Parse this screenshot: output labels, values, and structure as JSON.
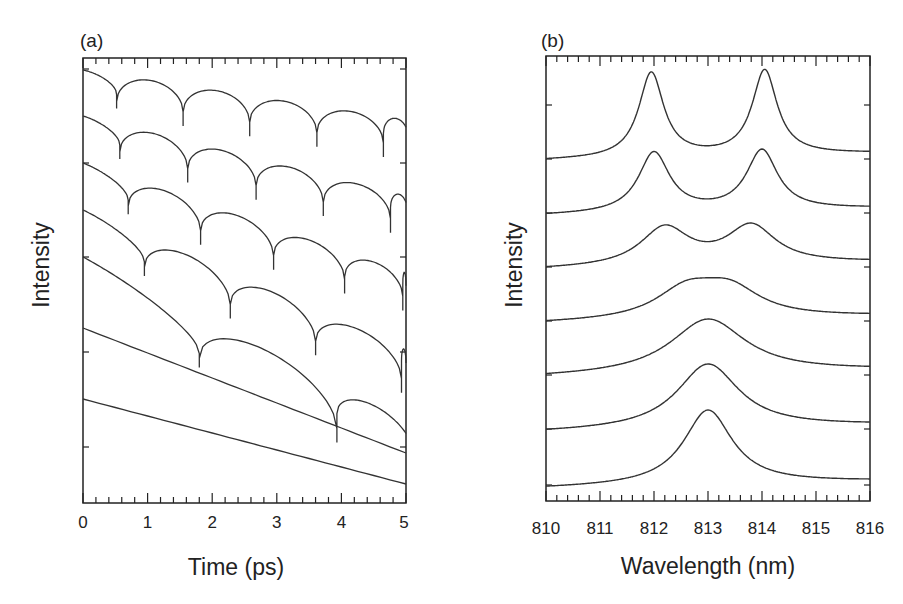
{
  "chart_data": [
    {
      "panel": "(a)",
      "type": "line",
      "title": "",
      "xlabel": "Time (ps)",
      "ylabel": "Intensity",
      "xlim": [
        0,
        5
      ],
      "xticks": [
        "0",
        "1",
        "2",
        "3",
        "4",
        "5"
      ],
      "grid": false,
      "legend": null,
      "description": "Seven vertically offset intensity traces; periodic sharp dips whose spacing grows from top to bottom; bottom traces are nearly linear decays.",
      "series": [
        {
          "name": "trace-1",
          "start_px": 70,
          "slope": 0.5,
          "dips": [
            0.52,
            1.55,
            2.58,
            3.62,
            4.65
          ]
        },
        {
          "name": "trace-2",
          "start_px": 116,
          "slope": 0.6,
          "dips": [
            0.57,
            1.62,
            2.68,
            3.72,
            4.76
          ]
        },
        {
          "name": "trace-3",
          "start_px": 163,
          "slope": 0.8,
          "dips": [
            0.7,
            1.82,
            2.95,
            4.05,
            4.95
          ]
        },
        {
          "name": "trace-4",
          "start_px": 210,
          "slope": 1.0,
          "dips": [
            0.95,
            2.28,
            3.6,
            4.93
          ]
        },
        {
          "name": "trace-5",
          "start_px": 257,
          "slope": 1.2,
          "dips": [
            1.8,
            3.93
          ]
        },
        {
          "name": "trace-6",
          "start_px": 328,
          "slope": 1.0,
          "dips": []
        },
        {
          "name": "trace-7",
          "start_px": 399,
          "slope": 1.0,
          "dips": []
        }
      ]
    },
    {
      "panel": "(b)",
      "type": "line",
      "title": "",
      "xlabel": "Wavelength (nm)",
      "ylabel": "Intensity",
      "xlim": [
        810,
        816
      ],
      "xticks": [
        "810",
        "811",
        "812",
        "813",
        "814",
        "815",
        "816"
      ],
      "grid": false,
      "legend": null,
      "description": "Seven vertically offset spectra; double peak at ~812 and ~814 nm at top merging into a single peak at 813 nm at bottom.",
      "series": [
        {
          "name": "spectrum-1",
          "baseline_px": 157,
          "peaks": [
            {
              "x": 811.95,
              "h": 85,
              "w": 0.28
            },
            {
              "x": 814.05,
              "h": 85,
              "w": 0.28
            }
          ]
        },
        {
          "name": "spectrum-2",
          "baseline_px": 212,
          "peaks": [
            {
              "x": 812.0,
              "h": 60,
              "w": 0.35
            },
            {
              "x": 814.0,
              "h": 60,
              "w": 0.35
            }
          ]
        },
        {
          "name": "spectrum-3",
          "baseline_px": 266,
          "peaks": [
            {
              "x": 812.2,
              "h": 38,
              "w": 0.55
            },
            {
              "x": 813.8,
              "h": 38,
              "w": 0.55
            }
          ]
        },
        {
          "name": "spectrum-4",
          "baseline_px": 320,
          "peaks": [
            {
              "x": 812.6,
              "h": 28,
              "w": 0.7
            },
            {
              "x": 813.4,
              "h": 28,
              "w": 0.7
            }
          ]
        },
        {
          "name": "spectrum-5",
          "baseline_px": 374,
          "peaks": [
            {
              "x": 813.0,
              "h": 55,
              "w": 0.85
            }
          ]
        },
        {
          "name": "spectrum-6",
          "baseline_px": 429,
          "peaks": [
            {
              "x": 813.0,
              "h": 65,
              "w": 0.7
            }
          ]
        },
        {
          "name": "spectrum-7",
          "baseline_px": 485,
          "peaks": [
            {
              "x": 813.0,
              "h": 75,
              "w": 0.55
            }
          ]
        }
      ]
    }
  ],
  "panel_a": {
    "label": "(a)",
    "xlabel": "Time (ps)",
    "ylabel": "Intensity",
    "ticks": [
      "0",
      "1",
      "2",
      "3",
      "4",
      "5"
    ]
  },
  "panel_b": {
    "label": "(b)",
    "xlabel": "Wavelength (nm)",
    "ylabel": "Intensity",
    "ticks": [
      "810",
      "811",
      "812",
      "813",
      "814",
      "815",
      "816"
    ]
  }
}
